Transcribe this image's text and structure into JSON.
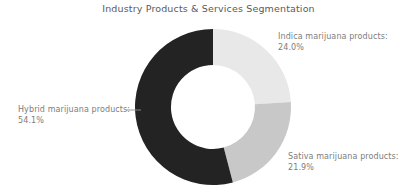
{
  "chart_data": {
    "type": "pie",
    "variant": "donut",
    "title": "Industry Products & Services Segmentation",
    "xlabel": "",
    "ylabel": "",
    "grid": false,
    "legend_position": "outside-labels",
    "total_pct": 100.0,
    "categories": [
      "Hybrid marijuana products",
      "Indica marijuana products",
      "Sativa marijuana products"
    ],
    "values": [
      54.1,
      24.0,
      21.9
    ],
    "value_labels": [
      "54.1%",
      "24.0%",
      "21.9%"
    ],
    "colors": [
      "#232323",
      "#e8e8e8",
      "#c8c8c8"
    ],
    "slices": [
      {
        "name": "Indica marijuana products",
        "label": "Indica marijuana products:",
        "value": 24.0,
        "value_label": "24.0%",
        "color": "#e8e8e8",
        "start_angle_deg": 0,
        "end_angle_deg": 86.4
      },
      {
        "name": "Sativa marijuana products",
        "label": "Sativa marijuana products:",
        "value": 21.9,
        "value_label": "21.9%",
        "color": "#c8c8c8",
        "start_angle_deg": 86.4,
        "end_angle_deg": 165.24
      },
      {
        "name": "Hybrid marijuana products",
        "label": "Hybrid marijuana products:",
        "value": 54.1,
        "value_label": "54.1%",
        "color": "#232323",
        "start_angle_deg": 165.24,
        "end_angle_deg": 360
      }
    ],
    "geometry": {
      "center_x": 213,
      "center_y": 107,
      "outer_radius": 78,
      "inner_radius": 42
    }
  },
  "title_color": "#5a5a5a",
  "label_color": "#7d7d7d",
  "background_color": "#ffffff"
}
